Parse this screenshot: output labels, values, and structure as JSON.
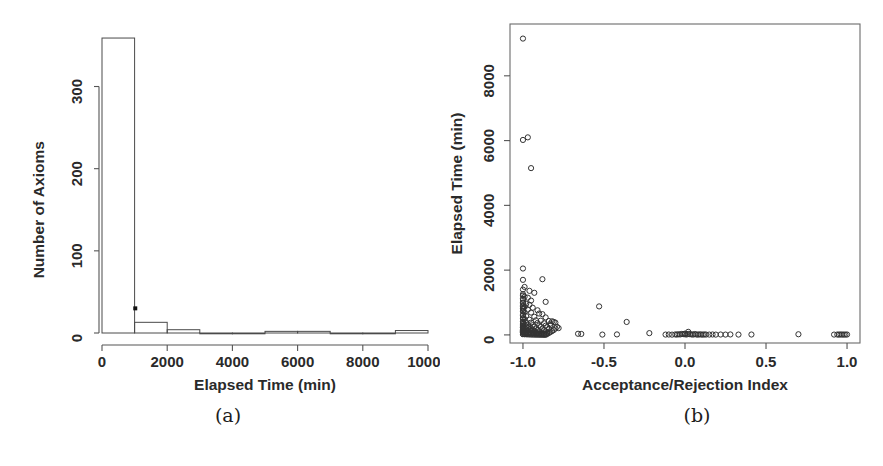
{
  "figure": {
    "caption_a": "(a)",
    "caption_b": "(b)"
  },
  "chart_data": [
    {
      "id": "histogram-elapsed-time",
      "type": "bar",
      "title": "",
      "xlabel": "Elapsed Time (min)",
      "ylabel": "Number of Axioms",
      "xlim": [
        0,
        10000
      ],
      "ylim": [
        0,
        370
      ],
      "xticks": [
        0,
        2000,
        4000,
        6000,
        8000,
        10000
      ],
      "xtick_labels": [
        "0",
        "2000",
        "4000",
        "6000",
        "8000",
        "10000"
      ],
      "yticks": [
        0,
        100,
        200,
        300
      ],
      "ytick_labels": [
        "0",
        "100",
        "200",
        "300"
      ],
      "grid": false,
      "legend": "none",
      "bin_width": 1000,
      "bin_edges": [
        0,
        1000,
        2000,
        3000,
        4000,
        5000,
        6000,
        7000,
        8000,
        9000,
        10000
      ],
      "categories": [
        "0-1000",
        "1000-2000",
        "2000-3000",
        "3000-4000",
        "4000-5000",
        "5000-6000",
        "6000-7000",
        "7000-8000",
        "8000-9000",
        "9000-10000"
      ],
      "values": [
        359,
        13,
        4,
        0,
        0,
        2,
        2,
        0,
        0,
        3
      ],
      "annotation": {
        "label": "outlier-marker",
        "x": 1020,
        "y": 30
      }
    },
    {
      "id": "scatter-index-vs-time",
      "type": "scatter",
      "title": "",
      "xlabel": "Acceptance/Rejection Index",
      "ylabel": "Elapsed Time (min)",
      "xlim": [
        -1.08,
        1.08
      ],
      "ylim": [
        -250,
        9600
      ],
      "xticks": [
        -1.0,
        -0.5,
        0.0,
        0.5,
        1.0
      ],
      "xtick_labels": [
        "-1.0",
        "-0.5",
        "0.0",
        "0.5",
        "1.0"
      ],
      "yticks": [
        0,
        2000,
        4000,
        6000,
        8000
      ],
      "ytick_labels": [
        "0",
        "2000",
        "4000",
        "6000",
        "8000"
      ],
      "grid": false,
      "legend": "none",
      "marker": "open-circle",
      "points": [
        [
          -1.0,
          9150
        ],
        [
          -1.0,
          6020
        ],
        [
          -0.97,
          6100
        ],
        [
          -0.95,
          5150
        ],
        [
          -1.0,
          2050
        ],
        [
          -1.0,
          1700
        ],
        [
          -0.88,
          1720
        ],
        [
          -0.99,
          1480
        ],
        [
          -1.0,
          1400
        ],
        [
          -0.96,
          1360
        ],
        [
          -0.93,
          1300
        ],
        [
          -1.0,
          1260
        ],
        [
          -1.0,
          1210
        ],
        [
          -0.99,
          1180
        ],
        [
          -0.97,
          1150
        ],
        [
          -1.0,
          1120
        ],
        [
          -1.0,
          1080
        ],
        [
          -0.95,
          1060
        ],
        [
          -0.86,
          1020
        ],
        [
          -1.0,
          1000
        ],
        [
          -1.0,
          980
        ],
        [
          -0.98,
          960
        ],
        [
          -0.96,
          930
        ],
        [
          -1.0,
          900
        ],
        [
          -1.0,
          880
        ],
        [
          -0.99,
          860
        ],
        [
          -0.94,
          840
        ],
        [
          -1.0,
          820
        ],
        [
          -1.0,
          800
        ],
        [
          -0.97,
          780
        ],
        [
          -0.91,
          760
        ],
        [
          -0.53,
          880
        ],
        [
          -1.0,
          740
        ],
        [
          -1.0,
          720
        ],
        [
          -0.99,
          700
        ],
        [
          -0.95,
          690
        ],
        [
          -0.9,
          660
        ],
        [
          -0.88,
          640
        ],
        [
          -1.0,
          620
        ],
        [
          -1.0,
          600
        ],
        [
          -0.98,
          580
        ],
        [
          -0.93,
          560
        ],
        [
          -0.86,
          540
        ],
        [
          -1.0,
          520
        ],
        [
          -1.0,
          500
        ],
        [
          -0.99,
          490
        ],
        [
          -0.96,
          470
        ],
        [
          -0.92,
          450
        ],
        [
          -0.89,
          440
        ],
        [
          -0.84,
          430
        ],
        [
          -0.82,
          420
        ],
        [
          -1.0,
          410
        ],
        [
          -1.0,
          400
        ],
        [
          -0.98,
          390
        ],
        [
          -0.95,
          380
        ],
        [
          -0.91,
          370
        ],
        [
          -0.87,
          360
        ],
        [
          -0.83,
          350
        ],
        [
          -0.36,
          400
        ],
        [
          -1.0,
          340
        ],
        [
          -1.0,
          330
        ],
        [
          -0.99,
          320
        ],
        [
          -0.97,
          310
        ],
        [
          -0.94,
          300
        ],
        [
          -0.9,
          290
        ],
        [
          -0.86,
          285
        ],
        [
          -0.81,
          400
        ],
        [
          -1.0,
          280
        ],
        [
          -1.0,
          270
        ],
        [
          -0.98,
          260
        ],
        [
          -0.96,
          255
        ],
        [
          -0.93,
          250
        ],
        [
          -0.89,
          245
        ],
        [
          -0.85,
          240
        ],
        [
          -0.8,
          380
        ],
        [
          -1.0,
          230
        ],
        [
          -1.0,
          220
        ],
        [
          -0.99,
          215
        ],
        [
          -0.97,
          210
        ],
        [
          -0.95,
          205
        ],
        [
          -0.92,
          200
        ],
        [
          -0.88,
          195
        ],
        [
          -0.84,
          190
        ],
        [
          -1.0,
          180
        ],
        [
          -1.0,
          175
        ],
        [
          -0.98,
          170
        ],
        [
          -0.96,
          165
        ],
        [
          -0.94,
          160
        ],
        [
          -0.91,
          155
        ],
        [
          -0.87,
          150
        ],
        [
          -0.83,
          300
        ],
        [
          -1.0,
          145
        ],
        [
          -1.0,
          140
        ],
        [
          -0.99,
          135
        ],
        [
          -0.97,
          130
        ],
        [
          -0.95,
          125
        ],
        [
          -0.93,
          120
        ],
        [
          -0.9,
          115
        ],
        [
          -0.86,
          110
        ],
        [
          -1.0,
          105
        ],
        [
          -1.0,
          100
        ],
        [
          -0.98,
          95
        ],
        [
          -0.96,
          90
        ],
        [
          -0.94,
          85
        ],
        [
          -0.92,
          80
        ],
        [
          -0.89,
          78
        ],
        [
          -0.85,
          75
        ],
        [
          -1.0,
          72
        ],
        [
          -1.0,
          68
        ],
        [
          -0.99,
          65
        ],
        [
          -0.98,
          62
        ],
        [
          -0.97,
          58
        ],
        [
          -0.96,
          55
        ],
        [
          -0.95,
          52
        ],
        [
          -0.94,
          48
        ],
        [
          -0.93,
          45
        ],
        [
          -0.92,
          42
        ],
        [
          -0.91,
          40
        ],
        [
          -0.9,
          38
        ],
        [
          -0.89,
          35
        ],
        [
          -0.88,
          32
        ],
        [
          -0.87,
          30
        ],
        [
          -0.86,
          28
        ],
        [
          -1.0,
          25
        ],
        [
          -1.0,
          22
        ],
        [
          -0.99,
          20
        ],
        [
          -0.98,
          18
        ],
        [
          -0.97,
          16
        ],
        [
          -0.96,
          14
        ],
        [
          -0.95,
          12
        ],
        [
          -0.94,
          10
        ],
        [
          -0.93,
          9
        ],
        [
          -0.92,
          8
        ],
        [
          -0.91,
          7
        ],
        [
          -0.9,
          6
        ],
        [
          -0.89,
          5
        ],
        [
          -0.88,
          4
        ],
        [
          -0.87,
          3
        ],
        [
          -0.86,
          2
        ],
        [
          -0.85,
          30
        ],
        [
          -0.84,
          60
        ],
        [
          -0.83,
          90
        ],
        [
          -0.82,
          120
        ],
        [
          -0.81,
          150
        ],
        [
          -0.8,
          200
        ],
        [
          -0.79,
          250
        ],
        [
          -0.78,
          210
        ],
        [
          -0.66,
          35
        ],
        [
          -0.64,
          30
        ],
        [
          -0.51,
          10
        ],
        [
          -0.42,
          15
        ],
        [
          -0.22,
          55
        ],
        [
          -0.12,
          10
        ],
        [
          -0.1,
          12
        ],
        [
          -0.08,
          8
        ],
        [
          -0.06,
          15
        ],
        [
          -0.05,
          10
        ],
        [
          -0.04,
          20
        ],
        [
          -0.03,
          14
        ],
        [
          -0.02,
          30
        ],
        [
          -0.01,
          25
        ],
        [
          0.0,
          40
        ],
        [
          0.0,
          18
        ],
        [
          0.01,
          12
        ],
        [
          0.02,
          95
        ],
        [
          0.02,
          30
        ],
        [
          0.03,
          22
        ],
        [
          0.04,
          16
        ],
        [
          0.05,
          10
        ],
        [
          0.06,
          26
        ],
        [
          0.07,
          14
        ],
        [
          0.08,
          8
        ],
        [
          0.09,
          18
        ],
        [
          0.1,
          12
        ],
        [
          0.11,
          9
        ],
        [
          0.12,
          15
        ],
        [
          0.13,
          11
        ],
        [
          0.15,
          10
        ],
        [
          0.17,
          13
        ],
        [
          0.19,
          9
        ],
        [
          0.22,
          12
        ],
        [
          0.25,
          10
        ],
        [
          0.28,
          14
        ],
        [
          0.33,
          10
        ],
        [
          0.41,
          12
        ],
        [
          0.7,
          20
        ],
        [
          0.92,
          10
        ],
        [
          0.94,
          12
        ],
        [
          0.95,
          9
        ],
        [
          0.96,
          14
        ],
        [
          0.97,
          10
        ],
        [
          0.98,
          11
        ],
        [
          0.99,
          10
        ],
        [
          1.0,
          12
        ]
      ]
    }
  ]
}
